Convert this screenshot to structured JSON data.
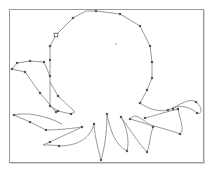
{
  "figure": {
    "frame": {
      "x": 9,
      "y": 9,
      "width": 194,
      "height": 153,
      "stroke": "#9a9a9a"
    },
    "line_color": "#8c8c8c",
    "node_color": "#555555",
    "paths": [
      {
        "name": "head",
        "d": "M50 106 L50 76 L50 60 L50 46 L56 35 L73 18 L86 11 L96 11 L120 14 L140 26 L150 46 L152 62 L152 78 L147 90 L140 103"
      },
      {
        "name": "arm-left-upper",
        "d": "M50 76 L44 62 L30 61 L17 63 L12 69 L25 72 L40 93 L56 112"
      },
      {
        "name": "arm-left-inner",
        "d": "M50 106 L58 111 L71 114 L75 112 L58 96 L50 82"
      },
      {
        "name": "arm-left-lower",
        "d": "M62 124 C45 115 25 112 14 115 L30 122 L46 130 C60 130 75 128 82 127"
      },
      {
        "name": "arm-bottom-left",
        "d": "M82 127 C70 133 58 138 50 142 L43 145 C55 145 62 146 59 146 C75 146 90 140 94 124"
      },
      {
        "name": "arm-bottom-center",
        "d": "M94 124 C95 140 100 155 101 160 C104 150 107 135 107 114"
      },
      {
        "name": "arm-bottom-mid",
        "d": "M107 114 C110 130 115 145 127 151 C130 140 126 125 121 117"
      },
      {
        "name": "arm-bottom-right",
        "d": "M121 117 C130 130 140 145 147 152 C150 145 150 135 153 127 C140 118 135 112 130 119"
      },
      {
        "name": "arm-right-lower",
        "d": "M130 119 C150 125 170 130 180 134 C185 130 180 120 178 109 C165 112 150 117 145 118"
      },
      {
        "name": "arm-right-upper",
        "d": "M140 103 C150 110 160 112 168 110 C180 105 190 97 196 102 C205 110 200 115 197 113 C188 105 176 105 173 109"
      }
    ],
    "nodes": [
      [
        50,
        106
      ],
      [
        50,
        76
      ],
      [
        50,
        60
      ],
      [
        50,
        46
      ],
      [
        56,
        35
      ],
      [
        73,
        18
      ],
      [
        96,
        11
      ],
      [
        120,
        14
      ],
      [
        140,
        26
      ],
      [
        150,
        46
      ],
      [
        152,
        62
      ],
      [
        152,
        78
      ],
      [
        147,
        90
      ],
      [
        140,
        103
      ],
      [
        44,
        62
      ],
      [
        30,
        61
      ],
      [
        17,
        63
      ],
      [
        12,
        69
      ],
      [
        25,
        72
      ],
      [
        40,
        93
      ],
      [
        56,
        112
      ],
      [
        58,
        111
      ],
      [
        71,
        114
      ],
      [
        58,
        96
      ],
      [
        14,
        115
      ],
      [
        30,
        122
      ],
      [
        46,
        130
      ],
      [
        82,
        127
      ],
      [
        50,
        142
      ],
      [
        59,
        146
      ],
      [
        94,
        124
      ],
      [
        101,
        160
      ],
      [
        107,
        114
      ],
      [
        127,
        151
      ],
      [
        121,
        117
      ],
      [
        147,
        152
      ],
      [
        153,
        127
      ],
      [
        130,
        119
      ],
      [
        180,
        134
      ],
      [
        178,
        109
      ],
      [
        145,
        118
      ],
      [
        168,
        110
      ],
      [
        196,
        102
      ],
      [
        197,
        113
      ],
      [
        173,
        109
      ]
    ],
    "open_nodes": [
      [
        56,
        35
      ]
    ],
    "center_marker": [
      116,
      44
    ]
  }
}
